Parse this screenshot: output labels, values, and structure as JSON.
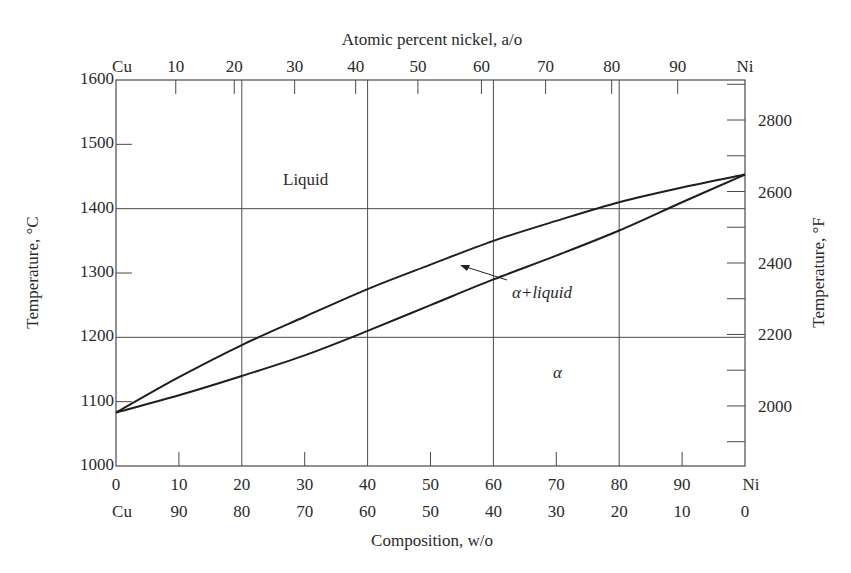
{
  "chart_data": {
    "type": "line",
    "top_axis": {
      "label": "Atomic percent nickel, a/o",
      "ticks": [
        {
          "label": "Cu",
          "wo": 0
        },
        {
          "label": "10",
          "wo": 9.5
        },
        {
          "label": "20",
          "wo": 18.8
        },
        {
          "label": "30",
          "wo": 28.4
        },
        {
          "label": "40",
          "wo": 38.1
        },
        {
          "label": "50",
          "wo": 48.0
        },
        {
          "label": "60",
          "wo": 58.1
        },
        {
          "label": "70",
          "wo": 68.3
        },
        {
          "label": "80",
          "wo": 78.8
        },
        {
          "label": "90",
          "wo": 89.3
        },
        {
          "label": "Ni",
          "wo": 100
        }
      ]
    },
    "bottom_axis": {
      "label": "Composition, w/o",
      "ticks_ni": [
        "0",
        "10",
        "20",
        "30",
        "40",
        "50",
        "60",
        "70",
        "80",
        "90",
        "Ni"
      ],
      "ticks_cu": [
        "Cu",
        "90",
        "80",
        "70",
        "60",
        "50",
        "40",
        "30",
        "20",
        "10",
        "0"
      ],
      "xlim": [
        0,
        100
      ]
    },
    "left_axis": {
      "label": "Temperature, °C",
      "ticks": [
        "1000",
        "1100",
        "1200",
        "1300",
        "1400",
        "1500",
        "1600"
      ],
      "ylim": [
        1000,
        1600
      ]
    },
    "right_axis": {
      "label": "Temperature, °F",
      "ticks": [
        "2000",
        "2200",
        "2400",
        "2600",
        "2800"
      ]
    },
    "grid": {
      "x": [
        20,
        40,
        60,
        80
      ],
      "y": [
        1200,
        1400
      ]
    },
    "x": [
      0,
      10,
      20,
      30,
      40,
      50,
      60,
      70,
      80,
      90,
      100
    ],
    "series": [
      {
        "name": "Liquidus",
        "values": [
          1083,
          1138,
          1188,
          1232,
          1275,
          1313,
          1350,
          1381,
          1410,
          1433,
          1453
        ]
      },
      {
        "name": "Solidus",
        "values": [
          1083,
          1110,
          1140,
          1172,
          1210,
          1250,
          1290,
          1327,
          1366,
          1410,
          1453
        ]
      }
    ],
    "annotations": [
      {
        "text": "Liquid",
        "x": 30,
        "y": 1450
      },
      {
        "text": "α+liquid",
        "x": 67,
        "y": 1268,
        "arrow_to": [
          55,
          1313
        ]
      },
      {
        "text": "α",
        "x": 70,
        "y": 1150
      }
    ]
  }
}
